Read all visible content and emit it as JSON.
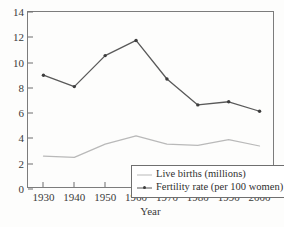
{
  "chart_data": {
    "type": "line",
    "title": "",
    "xlabel": "Year",
    "ylabel": "",
    "x": [
      1930,
      1940,
      1950,
      1960,
      1970,
      1980,
      1990,
      2000
    ],
    "xtick_labels": [
      "1930",
      "1940",
      "1950",
      "1960",
      "1970",
      "1980",
      "1990",
      "2000"
    ],
    "ytick_labels": [
      "0",
      "2",
      "4",
      "6",
      "8",
      "10",
      "12",
      "14"
    ],
    "ytick_values": [
      0,
      2,
      4,
      6,
      8,
      10,
      12,
      14
    ],
    "xlim": [
      1925,
      2005
    ],
    "ylim": [
      0,
      14
    ],
    "grid": false,
    "legend_position": "lower-center",
    "series": [
      {
        "name": "Live births (millions)",
        "color": "#b9b9b9",
        "marker": "none",
        "values": [
          2.6,
          2.5,
          3.55,
          4.2,
          3.55,
          3.45,
          3.9,
          3.4
        ]
      },
      {
        "name": "Fertility rate (per 100 women)",
        "color": "#595959",
        "marker": "dot",
        "values": [
          9.0,
          8.1,
          10.55,
          11.75,
          8.7,
          6.65,
          6.9,
          6.15
        ]
      }
    ]
  },
  "axes": {
    "x_title": "Year"
  },
  "legend": {
    "items": [
      {
        "label": "Live births (millions)"
      },
      {
        "label": "Fertility rate (per 100 women)"
      }
    ]
  }
}
